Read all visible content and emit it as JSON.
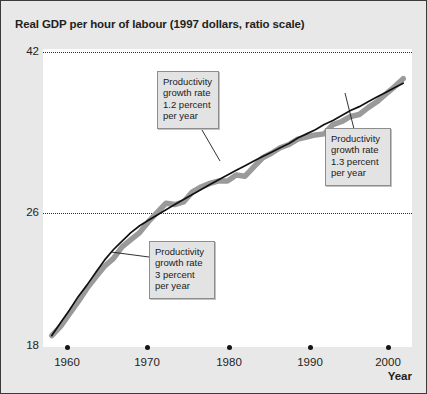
{
  "figure": {
    "title": "Real GDP per hour of labour (1997 dollars, ratio scale)",
    "axis_label_x": "Year",
    "background_color": "#e8e8e8",
    "plot_background_color": "#ffffff",
    "trend_line_color": "#111111",
    "data_band_color": "#9a9a9a"
  },
  "callouts": [
    {
      "id": "callout-1-2-percent",
      "text": "Productivity\ngrowth rate\n1.2 percent\nper year",
      "lines": [
        "Productivity",
        "growth rate",
        "1.2 percent",
        "per year"
      ]
    },
    {
      "id": "callout-1-3-percent",
      "text": "Productivity\ngrowth rate\n1.3 percent\nper year",
      "lines": [
        "Productivity",
        "growth rate",
        "1.3 percent",
        "per year"
      ]
    },
    {
      "id": "callout-3-percent",
      "text": "Productivity\ngrowth rate\n3 percent\nper year",
      "lines": [
        "Productivity",
        "growth rate",
        "3 percent",
        "per year"
      ]
    }
  ],
  "chart_data": {
    "type": "line",
    "title": "Real GDP per hour of labour (1997 dollars, ratio scale)",
    "xlabel": "Year",
    "ylabel": "Real GDP per hour of labour (1997 dollars, ratio scale)",
    "scale": "ratio (logarithmic)",
    "xlim": [
      1959,
      2001
    ],
    "ylim": [
      18,
      42
    ],
    "grid": "horizontal dotted at 26 and 42",
    "legend": "none",
    "ytick_labels": [
      "42",
      "26",
      "18"
    ],
    "ytick_values": [
      42,
      26,
      18
    ],
    "xtick_labels": [
      "1960",
      "1970",
      "1980",
      "1990",
      "2000"
    ],
    "xtick_values": [
      1960,
      1970,
      1980,
      1990,
      2000
    ],
    "x": [
      1960,
      1961,
      1962,
      1963,
      1964,
      1965,
      1966,
      1967,
      1968,
      1969,
      1970,
      1971,
      1972,
      1973,
      1974,
      1975,
      1976,
      1977,
      1978,
      1979,
      1980,
      1981,
      1982,
      1983,
      1984,
      1985,
      1986,
      1987,
      1988,
      1989,
      1990,
      1991,
      1992,
      1993,
      1994,
      1995,
      1996,
      1997,
      1998,
      1999,
      2000
    ],
    "series": [
      {
        "name": "Real GDP per hour of labour",
        "style": "thick grey band",
        "values": [
          18.6,
          19.1,
          19.8,
          20.5,
          21.3,
          22.0,
          22.7,
          23.2,
          24.0,
          24.5,
          25.0,
          25.8,
          26.5,
          27.2,
          27.1,
          27.3,
          28.1,
          28.5,
          28.8,
          29.0,
          29.0,
          29.5,
          29.4,
          30.2,
          31.0,
          31.4,
          31.9,
          32.2,
          32.7,
          32.9,
          33.1,
          33.2,
          34.1,
          34.4,
          34.9,
          35.1,
          35.8,
          36.4,
          37.2,
          38.0,
          38.9
        ]
      },
      {
        "name": "Trend (productivity growth path)",
        "style": "thin black line",
        "values": [
          18.6,
          19.3,
          20.0,
          20.8,
          21.5,
          22.3,
          23.1,
          23.8,
          24.4,
          25.0,
          25.5,
          25.9,
          26.3,
          26.7,
          27.1,
          27.5,
          27.9,
          28.3,
          28.7,
          29.1,
          29.5,
          29.9,
          30.3,
          30.7,
          31.1,
          31.5,
          31.9,
          32.3,
          32.8,
          33.2,
          33.6,
          34.1,
          34.5,
          35.0,
          35.5,
          35.9,
          36.4,
          36.9,
          37.4,
          37.9,
          38.4
        ]
      }
    ],
    "annotations": [
      {
        "text": "Productivity growth rate 3 percent per year",
        "applies_to_period": "1960-1970",
        "growth_rate_percent": 3
      },
      {
        "text": "Productivity growth rate 1.2 percent per year",
        "applies_to_period": "1970-1990",
        "growth_rate_percent": 1.2
      },
      {
        "text": "Productivity growth rate 1.3 percent per year",
        "applies_to_period": "1990-2000",
        "growth_rate_percent": 1.3
      }
    ]
  }
}
